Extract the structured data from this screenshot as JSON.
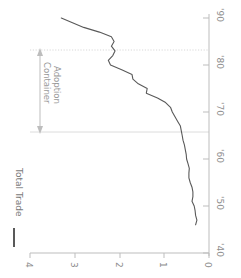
{
  "chart_data": {
    "type": "line",
    "title": "",
    "orientation": "rotated-90-clockwise",
    "xlabel": "",
    "ylabel": "",
    "xlim": [
      1946,
      1991
    ],
    "ylim": [
      0,
      4
    ],
    "grid": false,
    "legend": {
      "position": "left",
      "entries": [
        {
          "name": "Total Trade",
          "color": "#595959",
          "marker": "line-swatch"
        }
      ]
    },
    "x_tick_labels": [
      "'40",
      "'50",
      "'60",
      "'70",
      "'80",
      "'90"
    ],
    "x_tick_values": [
      1940,
      1950,
      1960,
      1970,
      1980,
      1990
    ],
    "y_tick_labels": [
      "0",
      "1",
      "2",
      "3",
      "4"
    ],
    "y_tick_values": [
      0,
      1,
      2,
      3,
      4
    ],
    "annotations": [
      {
        "text_line1": "Container",
        "text_line2": "Adoption",
        "type": "double-headed-arrow-span",
        "span_start": 1966,
        "span_end": 1983,
        "color": "#9a9a9a"
      }
    ],
    "reference_lines": [
      {
        "value": 1966,
        "style": "solid",
        "color": "#d8d8d8"
      },
      {
        "value": 1983,
        "style": "dotted",
        "color": "#d8d8d8"
      }
    ],
    "series": [
      {
        "name": "Total Trade",
        "color": "#595959",
        "x": [
          1946,
          1947,
          1948,
          1949,
          1950,
          1951,
          1952,
          1953,
          1954,
          1955,
          1956,
          1957,
          1958,
          1959,
          1960,
          1961,
          1962,
          1963,
          1964,
          1965,
          1966,
          1967,
          1968,
          1969,
          1970,
          1971,
          1972,
          1973,
          1974,
          1975,
          1976,
          1977,
          1978,
          1979,
          1980,
          1981,
          1982,
          1983,
          1984,
          1985,
          1986,
          1987,
          1988,
          1989,
          1990
        ],
        "y": [
          0.3,
          0.27,
          0.3,
          0.31,
          0.33,
          0.38,
          0.36,
          0.36,
          0.38,
          0.42,
          0.45,
          0.45,
          0.44,
          0.47,
          0.5,
          0.51,
          0.53,
          0.55,
          0.58,
          0.6,
          0.62,
          0.64,
          0.7,
          0.76,
          0.82,
          0.86,
          0.97,
          1.15,
          1.4,
          1.38,
          1.58,
          1.7,
          1.72,
          1.95,
          2.2,
          2.25,
          2.15,
          2.1,
          2.18,
          2.12,
          2.18,
          2.45,
          2.8,
          3.05,
          3.3
        ]
      }
    ]
  },
  "axes": {
    "year_labels": [
      "'90",
      "'80",
      "'70",
      "'60",
      "'50",
      "'40"
    ],
    "value_labels": [
      "4",
      "3",
      "2",
      "1",
      "0"
    ]
  },
  "legend": {
    "series_label": "Total Trade"
  },
  "annotation": {
    "line1": "Container",
    "line2": "Adoption"
  },
  "colors": {
    "line": "#595959",
    "axis": "#b5b5b5",
    "text": "#8c8c8c",
    "gridline": "#d8d8d8",
    "annotation": "#9a9a9a",
    "background": "#ffffff"
  }
}
